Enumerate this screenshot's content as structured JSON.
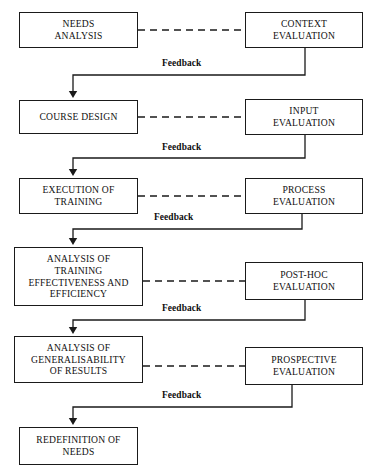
{
  "diagram": {
    "colors": {
      "line": "#1a1a1a",
      "box_border": "#1a1a1a",
      "background": "#ffffff",
      "text": "#111111"
    },
    "feedback_label": "Feedback",
    "process_nodes": [
      {
        "id": "needs-analysis",
        "label": "NEEDS\nANALYSIS",
        "x": 19,
        "y": 12,
        "w": 119,
        "h": 36
      },
      {
        "id": "course-design",
        "label": "COURSE DESIGN",
        "x": 19,
        "y": 100,
        "w": 119,
        "h": 34
      },
      {
        "id": "execution-of-training",
        "label": "EXECUTION OF\nTRAINING",
        "x": 19,
        "y": 178,
        "w": 119,
        "h": 36
      },
      {
        "id": "analysis-of-training-effectiveness",
        "label": "ANALYSIS OF\nTRAINING\nEFFECTIVENESS AND\nEFFICIENCY",
        "x": 14,
        "y": 247,
        "w": 129,
        "h": 59
      },
      {
        "id": "analysis-of-generalisability",
        "label": "ANALYSIS OF\nGENERALISABILITY\nOF RESULTS",
        "x": 14,
        "y": 336,
        "w": 129,
        "h": 47
      },
      {
        "id": "redefinition-of-needs",
        "label": "REDEFINITION OF\nNEEDS",
        "x": 19,
        "y": 427,
        "w": 119,
        "h": 38
      }
    ],
    "evaluation_nodes": [
      {
        "id": "context-evaluation",
        "label": "CONTEXT\nEVALUATION",
        "x": 245,
        "y": 12,
        "w": 118,
        "h": 36
      },
      {
        "id": "input-evaluation",
        "label": "INPUT\nEVALUATION",
        "x": 245,
        "y": 99,
        "w": 118,
        "h": 36
      },
      {
        "id": "process-evaluation",
        "label": "PROCESS\nEVALUATION",
        "x": 245,
        "y": 178,
        "w": 118,
        "h": 36
      },
      {
        "id": "post-hoc-evaluation",
        "label": "POST-HOC\nEVALUATION",
        "x": 245,
        "y": 262,
        "w": 118,
        "h": 38
      },
      {
        "id": "prospective-evaluation",
        "label": "PROSPECTIVE\nEVALUATION",
        "x": 245,
        "y": 347,
        "w": 118,
        "h": 38
      }
    ],
    "dashed_links": [
      {
        "id": "link-needs-context",
        "from": "needs-analysis",
        "to": "context-evaluation",
        "y": 30
      },
      {
        "id": "link-course-input",
        "from": "course-design",
        "to": "input-evaluation",
        "y": 117
      },
      {
        "id": "link-execution-process",
        "from": "execution-of-training",
        "to": "process-evaluation",
        "y": 196
      },
      {
        "id": "link-analysis-posthoc",
        "from": "analysis-of-training-effectiveness",
        "to": "post-hoc-evaluation",
        "y": 281
      },
      {
        "id": "link-generalisability-prospective",
        "from": "analysis-of-generalisability",
        "to": "prospective-evaluation",
        "y": 366
      }
    ],
    "feedback_loops": [
      {
        "id": "feedback-context-to-course",
        "from": "context-evaluation",
        "to": "course-design",
        "label_x": 160,
        "label_y": 58,
        "drop_x": 305,
        "rail_y": 75,
        "arrow_x": 73,
        "arrow_tip_y": 98
      },
      {
        "id": "feedback-input-to-execution",
        "from": "input-evaluation",
        "to": "execution-of-training",
        "label_x": 160,
        "label_y": 142,
        "drop_x": 305,
        "rail_y": 158,
        "arrow_x": 73,
        "arrow_tip_y": 176
      },
      {
        "id": "feedback-process-to-analysis",
        "from": "process-evaluation",
        "to": "analysis-of-training-effectiveness",
        "label_x": 152,
        "label_y": 212,
        "drop_x": 302,
        "rail_y": 229,
        "arrow_x": 73,
        "arrow_tip_y": 245
      },
      {
        "id": "feedback-posthoc-to-generalisability",
        "from": "post-hoc-evaluation",
        "to": "analysis-of-generalisability",
        "label_x": 160,
        "label_y": 303,
        "drop_x": 305,
        "rail_y": 320,
        "arrow_x": 73,
        "arrow_tip_y": 334
      },
      {
        "id": "feedback-prospective-to-redefinition",
        "from": "prospective-evaluation",
        "to": "redefinition-of-needs",
        "label_x": 160,
        "label_y": 390,
        "drop_x": 292,
        "rail_y": 407,
        "arrow_x": 73,
        "arrow_tip_y": 425
      }
    ]
  }
}
